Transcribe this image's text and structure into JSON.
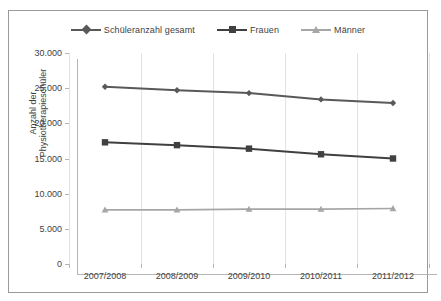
{
  "chart_data": {
    "type": "line",
    "title": "",
    "xlabel": "",
    "ylabel": "Anzahl der Physiotherapieschüler",
    "categories": [
      "2007/2008",
      "2008/2009",
      "2009/2010",
      "2010/2011",
      "2011/2012"
    ],
    "ylim": [
      0,
      30000
    ],
    "ytick_labels": [
      "30.000",
      "25.000",
      "20.000",
      "15.000",
      "10.000",
      "5.000",
      "0"
    ],
    "ytick_values": [
      30000,
      25000,
      20000,
      15000,
      10000,
      5000,
      0
    ],
    "grid": "vertical",
    "legend_position": "top-center",
    "series": [
      {
        "name": "Schüleranzahl gesamt",
        "marker": "diamond",
        "color": "#595959",
        "values": [
          25200,
          24700,
          24300,
          23400,
          22900
        ]
      },
      {
        "name": "Frauen",
        "marker": "square",
        "color": "#404040",
        "values": [
          17300,
          16900,
          16400,
          15600,
          15000
        ]
      },
      {
        "name": "Männer",
        "marker": "triangle",
        "color": "#a6a6a6",
        "values": [
          7700,
          7700,
          7800,
          7800,
          7900
        ]
      }
    ]
  },
  "colors": {
    "frame": "#9a9a9a",
    "gridline": "#e2e2e2",
    "axis": "#b5b5b5",
    "text": "#3f3f3f"
  }
}
